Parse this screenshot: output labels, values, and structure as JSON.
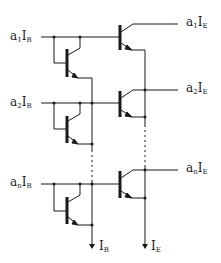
{
  "diagram": {
    "type": "circuit-schematic",
    "ink_color": "#1a1a1a",
    "background_color": "#ffffff",
    "rows": [
      {
        "input_label": {
          "coef": "a",
          "coef_sub": "1",
          "sym": "I",
          "sym_sub": "B"
        },
        "output_label": {
          "coef": "a",
          "coef_sub": "1",
          "sym": "I",
          "sym_sub": "E"
        }
      },
      {
        "input_label": {
          "coef": "a",
          "coef_sub": "2",
          "sym": "I",
          "sym_sub": "B"
        },
        "output_label": {
          "coef": "a",
          "coef_sub": "2",
          "sym": "I",
          "sym_sub": "E"
        }
      },
      {
        "input_label": {
          "coef": "a",
          "coef_sub": "n",
          "sym": "I",
          "sym_sub": "B"
        },
        "output_label": {
          "coef": "a",
          "coef_sub": "n",
          "sym": "I",
          "sym_sub": "E"
        }
      }
    ],
    "rail_outputs": [
      {
        "sym": "I",
        "sub": "B"
      },
      {
        "sym": "I",
        "sub": "E"
      }
    ]
  }
}
